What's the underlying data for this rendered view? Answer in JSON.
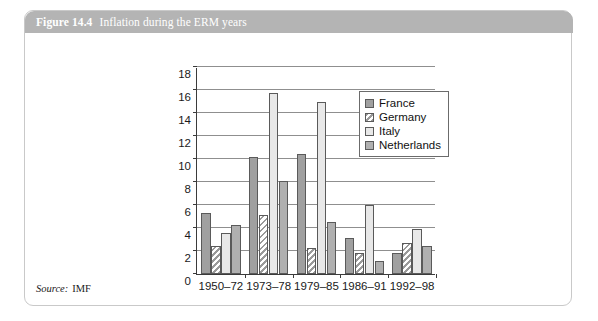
{
  "figure": {
    "number": "Figure 14.4",
    "title": "Inflation during the ERM years",
    "source_label": "Source:",
    "source_value": "IMF",
    "title_bar_color": "#b4b4b4",
    "border_color": "#c9c9c9"
  },
  "chart_data": {
    "type": "bar",
    "title": "Inflation during the ERM years",
    "xlabel": "",
    "ylabel": "",
    "categories": [
      "1950–72",
      "1973–78",
      "1979–85",
      "1986–91",
      "1992–98"
    ],
    "series": [
      {
        "name": "France",
        "values": [
          5.3,
          10.2,
          10.4,
          3.1,
          1.8
        ],
        "color": "#a0a0a0",
        "pattern": "solid"
      },
      {
        "name": "Germany",
        "values": [
          2.4,
          5.1,
          2.3,
          1.8,
          2.7
        ],
        "color": "#f0f0f0",
        "pattern": "diagonal-hatch"
      },
      {
        "name": "Italy",
        "values": [
          3.6,
          15.7,
          15.0,
          6.0,
          3.9
        ],
        "color": "#e8e8e8",
        "pattern": "solid"
      },
      {
        "name": "Netherlands",
        "values": [
          4.3,
          8.1,
          4.5,
          1.1,
          2.4
        ],
        "color": "#b0b0b0",
        "pattern": "solid"
      }
    ],
    "ylim": [
      0,
      18
    ],
    "yticks": [
      0,
      2,
      4,
      6,
      8,
      10,
      12,
      14,
      16,
      18
    ],
    "grid": true,
    "legend_position": "top-right"
  },
  "legend": {
    "items": [
      {
        "label": "France"
      },
      {
        "label": "Germany"
      },
      {
        "label": "Italy"
      },
      {
        "label": "Netherlands"
      }
    ]
  }
}
